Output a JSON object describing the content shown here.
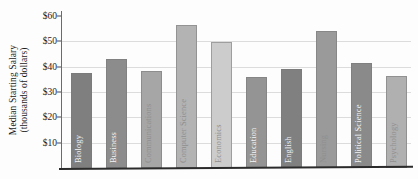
{
  "chart_data": {
    "type": "bar",
    "title": "",
    "xlabel": "",
    "ylabel": "Median Starting Salary (thousands of dollars)",
    "ylabel_line1": "Median Starting Salary",
    "ylabel_line2": "(thousands of dollars)",
    "ylim": [
      0,
      60
    ],
    "ytick_labels": [
      "$60",
      "$50",
      "$40",
      "$30",
      "$20",
      "$10"
    ],
    "ytick_values": [
      60,
      50,
      40,
      30,
      20,
      10
    ],
    "grid": true,
    "legend": "none",
    "categories": [
      "Biology",
      "Business",
      "Communications",
      "Computer Science",
      "Economics",
      "Education",
      "English",
      "Nursing",
      "Political Science",
      "Psychology"
    ],
    "values": [
      37.7,
      43.0,
      38.2,
      56.5,
      49.8,
      35.9,
      39.1,
      54.3,
      41.4,
      36.5
    ],
    "bar_colors": [
      "#7f7f7f",
      "#8c8c8c",
      "#a6a6a6",
      "#b3b3b3",
      "#cccccc",
      "#949494",
      "#808080",
      "#9a9a9a",
      "#8a8a8a",
      "#b0b0b0"
    ],
    "bar_shades": [
      "dark",
      "dark",
      "light",
      "light",
      "light",
      "dark",
      "dark",
      "light",
      "dark",
      "light"
    ],
    "axis_color": "#2b2b2b",
    "gridline_color": "#dcdcdc",
    "background_color": "#fdfdfd"
  },
  "figure": {
    "title_remnant": ""
  }
}
